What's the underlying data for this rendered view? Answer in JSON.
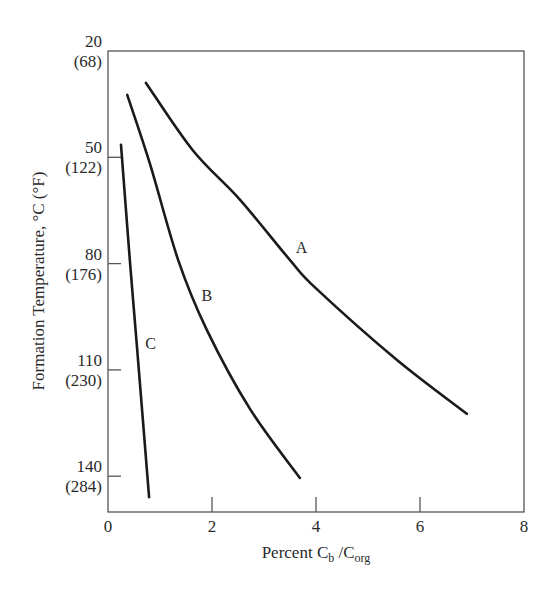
{
  "chart_data": {
    "type": "line",
    "title": "",
    "xlabel": "Percent C_b / C_org",
    "xlabel_parts": {
      "main": "Percent C",
      "sub1": "b",
      "sep": " /C",
      "sub2": "org"
    },
    "ylabel": "Formation Temperature, °C (°F)",
    "xlim": [
      0,
      8
    ],
    "ylim": [
      20,
      150
    ],
    "y_inverted": true,
    "grid": false,
    "legend": "inline curve labels",
    "x_ticks": [
      0,
      2,
      4,
      6,
      8
    ],
    "x_tick_labels": [
      "0",
      "2",
      "4",
      "6",
      "8"
    ],
    "y_ticks": [
      20,
      50,
      80,
      110,
      140
    ],
    "y_tick_labels": [
      {
        "c": "20",
        "f": "(68)"
      },
      {
        "c": "50",
        "f": "(122)"
      },
      {
        "c": "80",
        "f": "(176)"
      },
      {
        "c": "110",
        "f": "(230)"
      },
      {
        "c": "140",
        "f": "(284)"
      }
    ],
    "series": [
      {
        "name": "A",
        "label_pos": {
          "x": 3.72,
          "y": 77
        },
        "points": [
          {
            "x": 0.73,
            "y": 29
          },
          {
            "x": 1.63,
            "y": 48
          },
          {
            "x": 2.54,
            "y": 62
          },
          {
            "x": 3.5,
            "y": 79
          },
          {
            "x": 4.0,
            "y": 87
          },
          {
            "x": 5.54,
            "y": 107
          },
          {
            "x": 6.9,
            "y": 122.4
          }
        ]
      },
      {
        "name": "B",
        "label_pos": {
          "x": 1.9,
          "y": 90.5
        },
        "points": [
          {
            "x": 0.37,
            "y": 32.4
          },
          {
            "x": 0.81,
            "y": 52
          },
          {
            "x": 1.35,
            "y": 79
          },
          {
            "x": 1.9,
            "y": 98.7
          },
          {
            "x": 2.73,
            "y": 121
          },
          {
            "x": 3.69,
            "y": 140.5
          }
        ]
      },
      {
        "name": "C",
        "label_pos": {
          "x": 0.82,
          "y": 104
        },
        "points": [
          {
            "x": 0.25,
            "y": 46.5
          },
          {
            "x": 0.42,
            "y": 79
          },
          {
            "x": 0.56,
            "y": 104
          },
          {
            "x": 0.79,
            "y": 145.9
          }
        ]
      }
    ]
  }
}
